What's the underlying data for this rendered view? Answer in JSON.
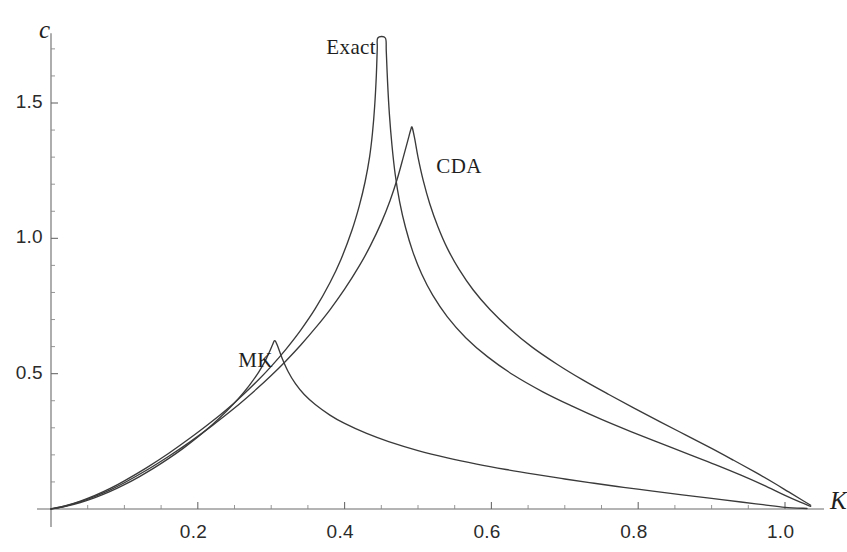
{
  "chart_data": {
    "type": "line",
    "title": "",
    "xlabel": "K",
    "ylabel": "c",
    "xlim": [
      0.0,
      1.045
    ],
    "ylim": [
      0.0,
      1.78
    ],
    "grid": false,
    "legend_position": "inline-annotations",
    "x_ticks": [
      {
        "value": 0.2,
        "label": "0.2"
      },
      {
        "value": 0.4,
        "label": "0.4"
      },
      {
        "value": 0.6,
        "label": "0.6"
      },
      {
        "value": 0.8,
        "label": "0.8"
      },
      {
        "value": 1.0,
        "label": "1.0"
      }
    ],
    "y_ticks": [
      {
        "value": 0.5,
        "label": "0.5"
      },
      {
        "value": 1.0,
        "label": "1.0"
      },
      {
        "value": 1.5,
        "label": "1.5"
      }
    ],
    "x_minor_step": 0.05,
    "y_minor_step": 0.1,
    "annotations": [
      {
        "text": "MK",
        "x": 0.255,
        "y": 0.545
      },
      {
        "text": "Exact",
        "x": 0.375,
        "y": 1.705
      },
      {
        "text": "CDA",
        "x": 0.525,
        "y": 1.265
      }
    ],
    "series": [
      {
        "name": "MK",
        "peak_x": 0.305,
        "peak_y": 0.622,
        "clipped_at_top": false,
        "points": [
          [
            0.0,
            0.0
          ],
          [
            0.02,
            0.01
          ],
          [
            0.04,
            0.024
          ],
          [
            0.06,
            0.042
          ],
          [
            0.08,
            0.064
          ],
          [
            0.1,
            0.09
          ],
          [
            0.12,
            0.119
          ],
          [
            0.14,
            0.151
          ],
          [
            0.16,
            0.186
          ],
          [
            0.18,
            0.224
          ],
          [
            0.2,
            0.266
          ],
          [
            0.22,
            0.312
          ],
          [
            0.24,
            0.364
          ],
          [
            0.255,
            0.407
          ],
          [
            0.27,
            0.456
          ],
          [
            0.283,
            0.506
          ],
          [
            0.292,
            0.548
          ],
          [
            0.298,
            0.583
          ],
          [
            0.302,
            0.608
          ],
          [
            0.305,
            0.622
          ],
          [
            0.309,
            0.6
          ],
          [
            0.315,
            0.556
          ],
          [
            0.323,
            0.508
          ],
          [
            0.333,
            0.463
          ],
          [
            0.345,
            0.423
          ],
          [
            0.36,
            0.386
          ],
          [
            0.38,
            0.347
          ],
          [
            0.4,
            0.316
          ],
          [
            0.43,
            0.279
          ],
          [
            0.46,
            0.249
          ],
          [
            0.5,
            0.216
          ],
          [
            0.54,
            0.189
          ],
          [
            0.58,
            0.166
          ],
          [
            0.62,
            0.146
          ],
          [
            0.66,
            0.128
          ],
          [
            0.7,
            0.111
          ],
          [
            0.74,
            0.095
          ],
          [
            0.78,
            0.08
          ],
          [
            0.82,
            0.066
          ],
          [
            0.86,
            0.052
          ],
          [
            0.9,
            0.039
          ],
          [
            0.94,
            0.026
          ],
          [
            0.97,
            0.016
          ],
          [
            1.0,
            0.006
          ],
          [
            1.03,
            0.002
          ]
        ]
      },
      {
        "name": "Exact",
        "peak_x": 0.445,
        "peak_y": 1.78,
        "clipped_at_top": true,
        "points": [
          [
            0.0,
            0.0
          ],
          [
            0.02,
            0.012
          ],
          [
            0.04,
            0.029
          ],
          [
            0.06,
            0.05
          ],
          [
            0.08,
            0.075
          ],
          [
            0.1,
            0.104
          ],
          [
            0.13,
            0.152
          ],
          [
            0.16,
            0.205
          ],
          [
            0.19,
            0.263
          ],
          [
            0.22,
            0.325
          ],
          [
            0.25,
            0.393
          ],
          [
            0.28,
            0.47
          ],
          [
            0.3,
            0.527
          ],
          [
            0.32,
            0.59
          ],
          [
            0.34,
            0.66
          ],
          [
            0.36,
            0.74
          ],
          [
            0.38,
            0.836
          ],
          [
            0.395,
            0.922
          ],
          [
            0.41,
            1.03
          ],
          [
            0.42,
            1.12
          ],
          [
            0.428,
            1.21
          ],
          [
            0.434,
            1.3
          ],
          [
            0.438,
            1.39
          ],
          [
            0.441,
            1.49
          ],
          [
            0.4432,
            1.6
          ],
          [
            0.4445,
            1.7
          ],
          [
            0.4452,
            1.79
          ],
          [
            0.4555,
            1.79
          ],
          [
            0.4568,
            1.69
          ],
          [
            0.4585,
            1.58
          ],
          [
            0.461,
            1.46
          ],
          [
            0.4645,
            1.345
          ],
          [
            0.469,
            1.235
          ],
          [
            0.475,
            1.135
          ],
          [
            0.483,
            1.04
          ],
          [
            0.493,
            0.95
          ],
          [
            0.505,
            0.868
          ],
          [
            0.52,
            0.79
          ],
          [
            0.54,
            0.71
          ],
          [
            0.565,
            0.633
          ],
          [
            0.595,
            0.562
          ],
          [
            0.63,
            0.495
          ],
          [
            0.67,
            0.433
          ],
          [
            0.71,
            0.38
          ],
          [
            0.75,
            0.331
          ],
          [
            0.79,
            0.286
          ],
          [
            0.83,
            0.243
          ],
          [
            0.87,
            0.201
          ],
          [
            0.905,
            0.164
          ],
          [
            0.94,
            0.125
          ],
          [
            0.97,
            0.089
          ],
          [
            1.0,
            0.05
          ],
          [
            1.02,
            0.026
          ],
          [
            1.035,
            0.01
          ]
        ]
      },
      {
        "name": "CDA",
        "peak_x": 0.492,
        "peak_y": 1.41,
        "clipped_at_top": false,
        "points": [
          [
            0.0,
            0.0
          ],
          [
            0.02,
            0.011
          ],
          [
            0.04,
            0.027
          ],
          [
            0.06,
            0.047
          ],
          [
            0.08,
            0.07
          ],
          [
            0.1,
            0.097
          ],
          [
            0.13,
            0.143
          ],
          [
            0.16,
            0.194
          ],
          [
            0.19,
            0.249
          ],
          [
            0.22,
            0.309
          ],
          [
            0.25,
            0.373
          ],
          [
            0.28,
            0.443
          ],
          [
            0.3,
            0.493
          ],
          [
            0.32,
            0.547
          ],
          [
            0.34,
            0.605
          ],
          [
            0.36,
            0.668
          ],
          [
            0.38,
            0.736
          ],
          [
            0.4,
            0.812
          ],
          [
            0.42,
            0.898
          ],
          [
            0.435,
            0.972
          ],
          [
            0.45,
            1.058
          ],
          [
            0.462,
            1.14
          ],
          [
            0.472,
            1.222
          ],
          [
            0.48,
            1.3
          ],
          [
            0.486,
            1.36
          ],
          [
            0.49,
            1.4
          ],
          [
            0.492,
            1.41
          ],
          [
            0.4955,
            1.368
          ],
          [
            0.5,
            1.3
          ],
          [
            0.507,
            1.215
          ],
          [
            0.516,
            1.128
          ],
          [
            0.527,
            1.044
          ],
          [
            0.54,
            0.963
          ],
          [
            0.556,
            0.885
          ],
          [
            0.575,
            0.81
          ],
          [
            0.598,
            0.737
          ],
          [
            0.625,
            0.666
          ],
          [
            0.655,
            0.599
          ],
          [
            0.69,
            0.534
          ],
          [
            0.725,
            0.476
          ],
          [
            0.76,
            0.423
          ],
          [
            0.795,
            0.372
          ],
          [
            0.83,
            0.322
          ],
          [
            0.865,
            0.273
          ],
          [
            0.9,
            0.224
          ],
          [
            0.93,
            0.18
          ],
          [
            0.96,
            0.135
          ],
          [
            0.985,
            0.096
          ],
          [
            1.005,
            0.063
          ],
          [
            1.022,
            0.035
          ],
          [
            1.035,
            0.014
          ]
        ]
      }
    ]
  },
  "axes": {
    "y_label_text": "c",
    "x_label_text": "K"
  }
}
